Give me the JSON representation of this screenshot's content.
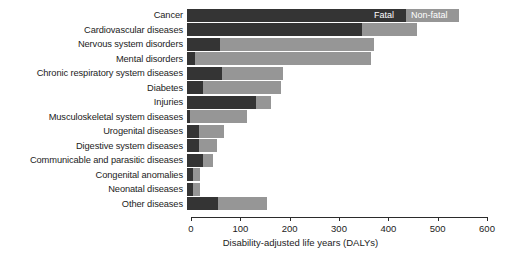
{
  "chart_data": {
    "type": "bar",
    "orientation": "horizontal",
    "stacked": true,
    "title": "",
    "xlabel": "Disability-adjusted life years (DALYs)",
    "ylabel": "",
    "xlim": [
      0,
      600
    ],
    "xticks": [
      0,
      100,
      200,
      300,
      400,
      500,
      600
    ],
    "xtick_labels": [
      "0",
      "100",
      "200",
      "300",
      "400",
      "500",
      "600"
    ],
    "grid": false,
    "legend_position": "inside-first-bar",
    "categories": [
      "Cancer",
      "Cardiovascular diseases",
      "Nervous system disorders",
      "Mental disorders",
      "Chronic respiratory system diseases",
      "Diabetes",
      "Injuries",
      "Musculoskeletal system diseases",
      "Urogenital diseases",
      "Digestive system diseases",
      "Communicable and parasitic diseases",
      "Congenital anomalies",
      "Neonatal diseases",
      "Other diseases"
    ],
    "series": [
      {
        "name": "Fatal",
        "color": "#343434",
        "values": [
          444,
          355,
          67,
          16,
          71,
          32,
          140,
          6,
          24,
          24,
          32,
          12,
          12,
          63
        ]
      },
      {
        "name": "Non-fatal",
        "color": "#969696",
        "values": [
          107,
          111,
          312,
          357,
          124,
          158,
          30,
          116,
          51,
          37,
          21,
          14,
          14,
          99
        ]
      }
    ],
    "totals": [
      551,
      466,
      379,
      373,
      195,
      190,
      170,
      122,
      75,
      61,
      53,
      26,
      26,
      162
    ]
  },
  "legend": {
    "fatal_label": "Fatal",
    "nonfatal_label": "Non-fatal"
  },
  "axis": {
    "label": "Disability-adjusted life years (DALYs)"
  }
}
